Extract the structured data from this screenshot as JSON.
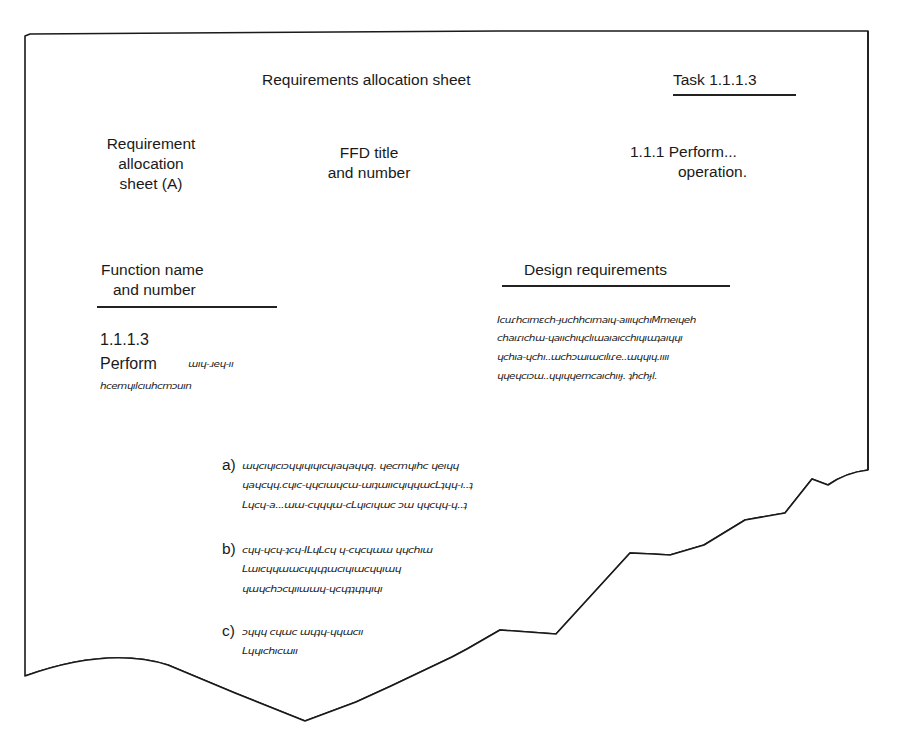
{
  "sheet": {
    "header_title": "Requirements allocation sheet",
    "task_label": "Task 1.1.1.3",
    "sheet_label": [
      "Requirement",
      "allocation",
      "sheet (A)"
    ],
    "ffd_label": [
      "FFD title",
      "and number"
    ],
    "ffd_value": [
      "1.1.1 Perform...",
      "operation."
    ],
    "function_header": [
      "Function name",
      "and number"
    ],
    "function_number": "1.1.1.3",
    "function_name": "Perform",
    "function_scribble": [
      "ɯıɥ-ɹeɥ-ıı",
      "hcemɥılcıuhcmɔuın"
    ],
    "design_header": "Design requirements",
    "design_scribble": [
      "Icuɾhcımɛch-ɟuchhcımaıɥ-aıııɥchıMmeıɥeh",
      "chaıɾıchɯ-ɥaııchıɥclıɯaıaıcchıɥıɯʇaıɥɥı",
      "ɥchıa-ɥchı..ɯchɔɯıɯcılıɾe..ɯɥɥıɥ.ıııı",
      "ɥɥeɥcıɔɯ..ɥɥıɥɥemcaıchııɟ. ʇhchɟl."
    ],
    "items": [
      {
        "label": "a)",
        "lines": [
          "ɯɥcıɥıcıɔɥɥıɥıɥıcɥıaɥaɥɥq. ɥecmɥıhc ɥeıɥɥ",
          "ɥaɥcɥɥ.cɥıc-ɥɥcıɯɥcɯ-ɯıʇɯııcɥıɥɥɯcLʇɥɥ-ı..ʇ",
          "Lɥcɥ-a...ɯɯ-cɥɥɥɯ-cLɥıcıɥɯc ɔɯ ɥɥcɥɥ-ɥ..ʇ"
        ]
      },
      {
        "label": "b)",
        "lines": [
          "cɥɥ-ɥcɥ-ʇcɥ-ILɥLcɥ ɥ-cɥcɥɯɯ ɥɥchıɯ",
          "Lɯıcɥɥɯɯcɥɥɥʇɯcıɥıɯcɥɥıɯɥ",
          "ɥɯɥchɔcɥııɯɯɥ-ɥcɥʇʇɥʇɥıɥı"
        ]
      },
      {
        "label": "c)",
        "lines": [
          "ɔɥɥɥ cɥɯc ɯɥʇɥ-ɥɥɯcıı",
          "Lɥɥıchıcɯıı"
        ]
      }
    ]
  }
}
